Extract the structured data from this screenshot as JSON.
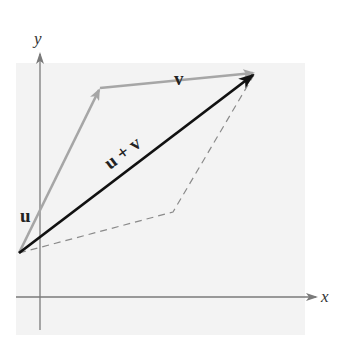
{
  "diagram": {
    "type": "vector-addition-parallelogram",
    "axes": {
      "x_label": "x",
      "y_label": "y"
    },
    "vectors": [
      {
        "name": "u",
        "label": "u",
        "from": [
          19,
          253
        ],
        "to": [
          100,
          88
        ],
        "color": "#a6a6a6",
        "style": "solid"
      },
      {
        "name": "v",
        "label": "v",
        "from": [
          100,
          88
        ],
        "to": [
          255,
          73
        ],
        "color": "#a6a6a6",
        "style": "solid"
      },
      {
        "name": "u_plus_v",
        "label": "u + v",
        "from": [
          19,
          253
        ],
        "to": [
          255,
          73
        ],
        "color": "#111111",
        "style": "solid"
      }
    ],
    "dashed_edges": [
      {
        "from": [
          19,
          253
        ],
        "to": [
          173,
          212
        ]
      },
      {
        "from": [
          173,
          212
        ],
        "to": [
          255,
          73
        ]
      }
    ],
    "colors": {
      "panel_background": "#f3f3f3",
      "axis": "#7a7a7a",
      "light_vector": "#a6a6a6",
      "sum_vector": "#111111",
      "dashed": "#8a8a8a"
    }
  }
}
